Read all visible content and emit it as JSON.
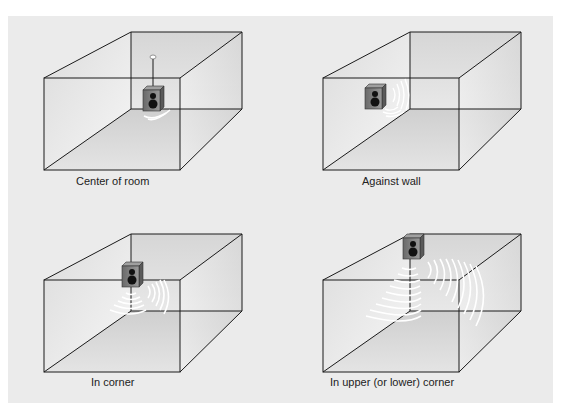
{
  "figure": {
    "background": "#ebebeb",
    "panels": [
      {
        "id": "center",
        "caption": "Center of room",
        "speaker_position": "center of room, suspended from ceiling",
        "wave_sets": 1
      },
      {
        "id": "wall",
        "caption": "Against wall",
        "speaker_position": "on left wall",
        "wave_sets": 1
      },
      {
        "id": "corner",
        "caption": "In corner",
        "speaker_position": "vertical corner edge",
        "wave_sets": 2
      },
      {
        "id": "upper-corner",
        "caption": "In upper (or lower) corner",
        "speaker_position": "upper back corner",
        "wave_sets": 2
      }
    ]
  },
  "colors": {
    "line": "#1a1a1a",
    "speaker_body": "#777777",
    "speaker_face": "#8c8c8c",
    "driver": "#1a1a1a",
    "waves": "#ffffff"
  }
}
